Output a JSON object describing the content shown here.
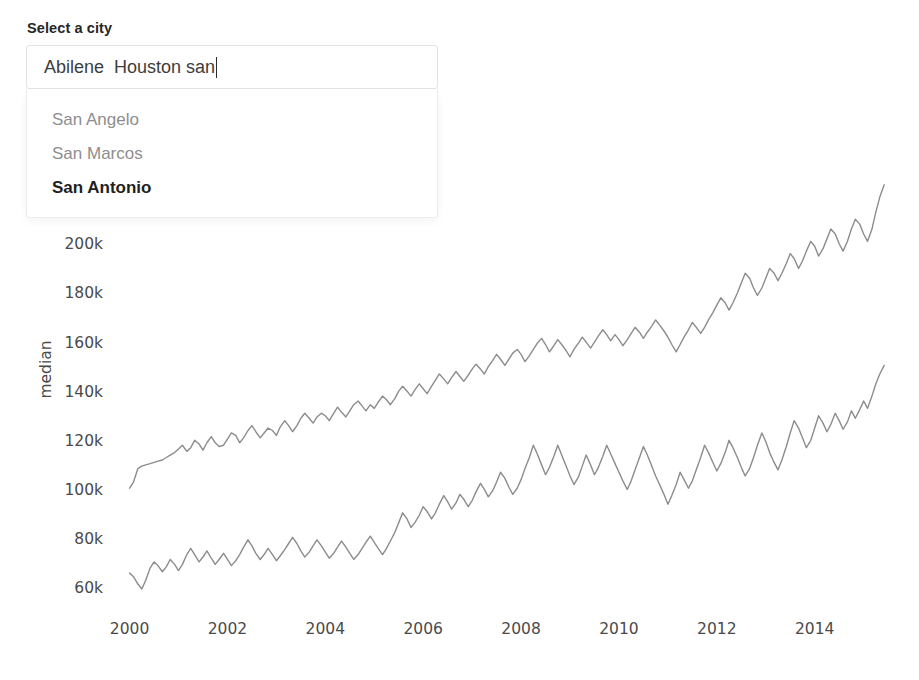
{
  "widget": {
    "label": "Select a city",
    "input_value": "Abilene  Houston san",
    "input_placeholder": "Select a city",
    "caret_visible": true,
    "options": [
      {
        "label": "San Angelo",
        "active": false
      },
      {
        "label": "San Marcos",
        "active": false
      },
      {
        "label": "San Antonio",
        "active": true
      }
    ]
  },
  "chart_data": {
    "type": "line",
    "title": "",
    "xlabel": "",
    "ylabel": "median",
    "xlim": [
      1999.6,
      2015.6
    ],
    "ylim": [
      55000,
      228000
    ],
    "grid": false,
    "legend": "none",
    "line_color": "#8c8c8c",
    "xticks": [
      2000,
      2002,
      2004,
      2006,
      2008,
      2010,
      2012,
      2014
    ],
    "xtick_labels": [
      "2000",
      "2002",
      "2004",
      "2006",
      "2008",
      "2010",
      "2012",
      "2014"
    ],
    "yticks": [
      60000,
      80000,
      100000,
      120000,
      140000,
      160000,
      180000,
      200000
    ],
    "ytick_labels": [
      "60k",
      "80k",
      "100k",
      "120k",
      "140k",
      "160k",
      "180k",
      "200k"
    ],
    "x": [
      2000.0,
      2000.08,
      2000.17,
      2000.25,
      2000.33,
      2000.42,
      2000.5,
      2000.58,
      2000.67,
      2000.75,
      2000.83,
      2000.92,
      2001.0,
      2001.08,
      2001.17,
      2001.25,
      2001.33,
      2001.42,
      2001.5,
      2001.58,
      2001.67,
      2001.75,
      2001.83,
      2001.92,
      2002.0,
      2002.08,
      2002.17,
      2002.25,
      2002.33,
      2002.42,
      2002.5,
      2002.58,
      2002.67,
      2002.75,
      2002.83,
      2002.92,
      2003.0,
      2003.08,
      2003.17,
      2003.25,
      2003.33,
      2003.42,
      2003.5,
      2003.58,
      2003.67,
      2003.75,
      2003.83,
      2003.92,
      2004.0,
      2004.08,
      2004.17,
      2004.25,
      2004.33,
      2004.42,
      2004.5,
      2004.58,
      2004.67,
      2004.75,
      2004.83,
      2004.92,
      2005.0,
      2005.08,
      2005.17,
      2005.25,
      2005.33,
      2005.42,
      2005.5,
      2005.58,
      2005.67,
      2005.75,
      2005.83,
      2005.92,
      2006.0,
      2006.08,
      2006.17,
      2006.25,
      2006.33,
      2006.42,
      2006.5,
      2006.58,
      2006.67,
      2006.75,
      2006.83,
      2006.92,
      2007.0,
      2007.08,
      2007.17,
      2007.25,
      2007.33,
      2007.42,
      2007.5,
      2007.58,
      2007.67,
      2007.75,
      2007.83,
      2007.92,
      2008.0,
      2008.08,
      2008.17,
      2008.25,
      2008.33,
      2008.42,
      2008.5,
      2008.58,
      2008.67,
      2008.75,
      2008.83,
      2008.92,
      2009.0,
      2009.08,
      2009.17,
      2009.25,
      2009.33,
      2009.42,
      2009.5,
      2009.58,
      2009.67,
      2009.75,
      2009.83,
      2009.92,
      2010.0,
      2010.08,
      2010.17,
      2010.25,
      2010.33,
      2010.42,
      2010.5,
      2010.58,
      2010.67,
      2010.75,
      2010.83,
      2010.92,
      2011.0,
      2011.08,
      2011.17,
      2011.25,
      2011.33,
      2011.42,
      2011.5,
      2011.58,
      2011.67,
      2011.75,
      2011.83,
      2011.92,
      2012.0,
      2012.08,
      2012.17,
      2012.25,
      2012.33,
      2012.42,
      2012.5,
      2012.58,
      2012.67,
      2012.75,
      2012.83,
      2012.92,
      2013.0,
      2013.08,
      2013.17,
      2013.25,
      2013.33,
      2013.42,
      2013.5,
      2013.58,
      2013.67,
      2013.75,
      2013.83,
      2013.92,
      2014.0,
      2014.08,
      2014.17,
      2014.25,
      2014.33,
      2014.42,
      2014.5,
      2014.58,
      2014.67,
      2014.75,
      2014.83,
      2014.92,
      2015.0,
      2015.08,
      2015.17,
      2015.25,
      2015.33,
      2015.42
    ],
    "series": [
      {
        "name": "Houston",
        "values": [
          100500,
          103000,
          108500,
          109500,
          110000,
          110500,
          111000,
          111500,
          112000,
          113000,
          114000,
          115000,
          116500,
          118000,
          115500,
          117000,
          120000,
          118500,
          116000,
          119000,
          121500,
          119000,
          117500,
          118000,
          120500,
          123000,
          122000,
          119000,
          121000,
          124000,
          126000,
          123500,
          121000,
          123000,
          125000,
          124000,
          122000,
          125500,
          128000,
          126000,
          123500,
          126000,
          129000,
          131000,
          129000,
          127000,
          129500,
          131000,
          130000,
          128000,
          131000,
          133500,
          131500,
          129500,
          132000,
          134500,
          136000,
          134000,
          132000,
          134500,
          133000,
          135500,
          138000,
          136500,
          134500,
          137000,
          140000,
          142000,
          140000,
          138000,
          140500,
          143000,
          141000,
          139000,
          142000,
          144500,
          147000,
          145000,
          143000,
          145500,
          148000,
          146000,
          144000,
          146500,
          149000,
          151000,
          149000,
          147000,
          150000,
          152500,
          155000,
          153000,
          150500,
          153000,
          155500,
          157000,
          155000,
          152000,
          154500,
          157000,
          159500,
          161500,
          159000,
          156000,
          158500,
          161000,
          159000,
          156500,
          154000,
          157000,
          159500,
          162000,
          160000,
          157500,
          160000,
          162500,
          165000,
          163000,
          160500,
          163000,
          161000,
          158500,
          161000,
          163500,
          166000,
          164000,
          161500,
          164000,
          166500,
          169000,
          167000,
          164500,
          162000,
          159000,
          156000,
          159000,
          162000,
          165000,
          168000,
          166000,
          163500,
          166000,
          169000,
          172000,
          175000,
          178000,
          176000,
          173000,
          176000,
          180000,
          184000,
          188000,
          186000,
          182000,
          179000,
          182000,
          186000,
          190000,
          188000,
          185000,
          188000,
          192000,
          196000,
          194000,
          190000,
          193000,
          197000,
          201000,
          199000,
          195000,
          198000,
          202000,
          206000,
          204000,
          200000,
          197000,
          201000,
          206000,
          210000,
          208000,
          204000,
          201000,
          206000,
          213000,
          219000,
          224000
        ]
      },
      {
        "name": "Abilene",
        "values": [
          66000,
          64500,
          61500,
          59500,
          63000,
          68000,
          70500,
          69000,
          66500,
          68500,
          71500,
          69500,
          67000,
          69500,
          73500,
          76000,
          73500,
          70500,
          72500,
          75000,
          72000,
          69500,
          71500,
          74000,
          71500,
          69000,
          71000,
          73500,
          76500,
          79500,
          77000,
          74000,
          71500,
          73500,
          76000,
          73500,
          71000,
          73000,
          75500,
          78000,
          80500,
          78000,
          75000,
          72500,
          74500,
          77000,
          79500,
          77000,
          74500,
          72000,
          74000,
          76500,
          79000,
          76500,
          74000,
          71500,
          73500,
          76000,
          78500,
          81000,
          78500,
          76000,
          73500,
          76000,
          79000,
          82500,
          86500,
          90500,
          88000,
          84500,
          86500,
          89500,
          93000,
          91000,
          88000,
          90500,
          94000,
          97500,
          95000,
          92000,
          94500,
          98000,
          96000,
          93000,
          95500,
          99000,
          102500,
          100000,
          97000,
          99500,
          103000,
          107000,
          104500,
          101000,
          98000,
          100500,
          104000,
          108500,
          113000,
          118000,
          114500,
          110000,
          106000,
          109000,
          113500,
          118000,
          114000,
          109500,
          105500,
          102000,
          105000,
          109500,
          114000,
          110000,
          106000,
          109000,
          113500,
          118000,
          114500,
          110500,
          107000,
          103500,
          100000,
          103500,
          108000,
          113000,
          117500,
          114000,
          109500,
          105500,
          102000,
          98000,
          94000,
          97500,
          102000,
          107000,
          104000,
          100500,
          103500,
          108000,
          113000,
          118000,
          115000,
          111000,
          107500,
          110500,
          115000,
          120000,
          117000,
          113000,
          109000,
          105500,
          108500,
          113000,
          118000,
          123000,
          119500,
          115000,
          111000,
          108000,
          112000,
          117500,
          123000,
          128000,
          125000,
          121000,
          117000,
          120000,
          125000,
          130000,
          127000,
          123500,
          126500,
          131000,
          128000,
          124500,
          127500,
          132000,
          129000,
          132500,
          136000,
          133000,
          138000,
          143000,
          147000,
          150500
        ]
      }
    ]
  }
}
